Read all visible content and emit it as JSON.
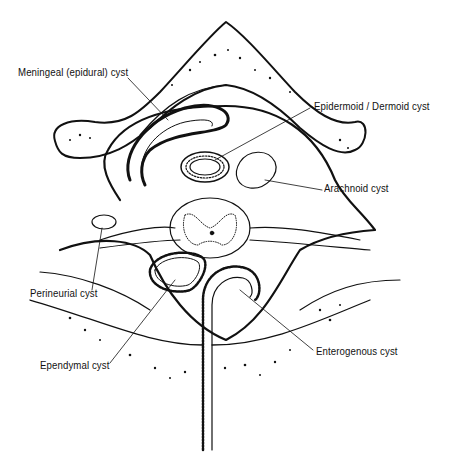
{
  "diagram": {
    "labels": {
      "meningeal": "Meningeal (epidural) cyst",
      "epidermoid": "Epidermoid / Dermoid cyst",
      "arachnoid": "Arachnoid cyst",
      "perineurial": "Perineurial cyst",
      "ependymal": "Ependymal cyst",
      "enterogenous": "Enterogenous cyst"
    },
    "colors": {
      "ink": "#111111",
      "background": "#ffffff"
    }
  }
}
